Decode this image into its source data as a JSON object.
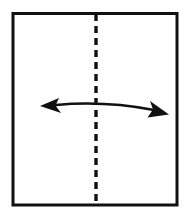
{
  "diagram": {
    "title": "Paper with vertical center fold line and bidirectional fold arrow",
    "type": "origami-fold-instruction",
    "background_color": "#ffffff",
    "ink_color": "#111111",
    "canvas": {
      "width": 195,
      "height": 218
    },
    "paper": {
      "label": "paper-sheet",
      "shape": "rectangle",
      "x": 13,
      "y": 13.5,
      "width": 164,
      "height": 191.5,
      "stroke_color": "#111111",
      "stroke_width": 3,
      "fill_color": "#ffffff"
    },
    "crease": {
      "label": "center-vertical-fold-line",
      "style": "dashed",
      "orientation": "vertical",
      "x": 96,
      "y_start": 14,
      "y_end": 205,
      "stroke_color": "#111111",
      "stroke_width": 3.4,
      "dash_length": 7,
      "gap_length": 5
    },
    "arrow": {
      "label": "fold-direction-arrow",
      "style": "double-headed-curved",
      "stroke_color": "#111111",
      "stroke_width": 2.6,
      "shaft_path": "M 56 105 Q 104 100.5 154 110",
      "left_head": {
        "label": "left-arrowhead",
        "style": "barbed-open-v",
        "tip_x": 40,
        "tip_y": 106,
        "points": "40,106 59,98 55.5,105.5 61,113"
      },
      "right_head": {
        "label": "right-arrowhead",
        "style": "solid-barbed-triangle",
        "tip_x": 169,
        "tip_y": 114,
        "points": "169,114.5 150,101 153,109.5 147.5,117.5"
      }
    }
  }
}
